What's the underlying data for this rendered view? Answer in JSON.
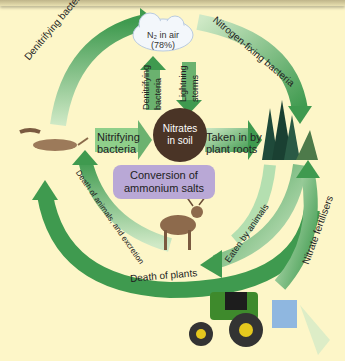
{
  "diagram": {
    "nodes": {
      "air": {
        "label_line1": "N₂ in air",
        "label_line2": "(78%)"
      },
      "soil": {
        "label_line1": "Nitrates",
        "label_line2": "in soil"
      },
      "conversion": {
        "label_line1": "Conversion of",
        "label_line2": "ammonium salts"
      }
    },
    "arrows": {
      "denitrifying_outer": "Denitrifying bacteria",
      "nitrogen_fixing": "Nitrogen-fixing bacteria",
      "denitrifying_inner_line1": "Denitrifying",
      "denitrifying_inner_line2": "bacteria",
      "lightning_line1": "Lightning",
      "lightning_line2": "storms",
      "nitrifying_line1": "Nitrifying",
      "nitrifying_line2": "bacteria",
      "taken_in_line1": "Taken in by",
      "taken_in_line2": "plant roots",
      "eaten": "Eaten by animals",
      "death_animals": "Death of animals, and excretion",
      "death_plants": "Death of plants",
      "fertilisers": "Nitrate fertilisers"
    },
    "colors": {
      "background": "#fdf6c8",
      "arrow_green": "#3f9a4f",
      "arrow_light": "#a9d8a6",
      "soil_brown": "#4a3426",
      "conversion_purple": "#b9a8d6"
    }
  }
}
